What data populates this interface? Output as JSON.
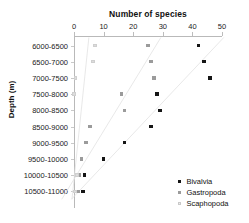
{
  "chart_data": {
    "type": "scatter",
    "title": "Number of species",
    "xlabel": "Number of species",
    "ylabel": "Depth (m)",
    "orientation": "horizontal-categories",
    "grid": false,
    "legend_position": "bottom-right",
    "xlim": [
      0,
      50
    ],
    "xticks": [
      "0",
      "10",
      "20",
      "30",
      "40",
      "50"
    ],
    "categories": [
      "6000-6500",
      "6500-7000",
      "7000-7500",
      "7500-8000",
      "8000-8500",
      "8500-9000",
      "9000-9500",
      "9500-10000",
      "10000-10500",
      "10500-11000"
    ],
    "series": [
      {
        "name": "Bivalvia",
        "color": "#151515",
        "values": [
          42,
          44,
          46,
          28,
          29,
          26,
          17,
          10,
          3.5,
          3
        ],
        "trendline": true
      },
      {
        "name": "Gastropoda",
        "color": "#9b9b9b",
        "values": [
          25,
          26,
          27,
          16,
          17,
          5.5,
          4,
          2.5,
          1.7,
          1.3
        ],
        "trendline": true
      },
      {
        "name": "Scaphopoda",
        "color": "#dcdcdc",
        "values": [
          7,
          6.5,
          0.5,
          0,
          null,
          null,
          null,
          null,
          1,
          0.3
        ],
        "trendline": true
      }
    ]
  },
  "legend": {
    "items": [
      {
        "label": "Bivalvia",
        "key": "bivalvia"
      },
      {
        "label": "Gastropoda",
        "key": "gastropoda"
      },
      {
        "label": "Scaphopoda",
        "key": "scaphopoda"
      }
    ]
  }
}
